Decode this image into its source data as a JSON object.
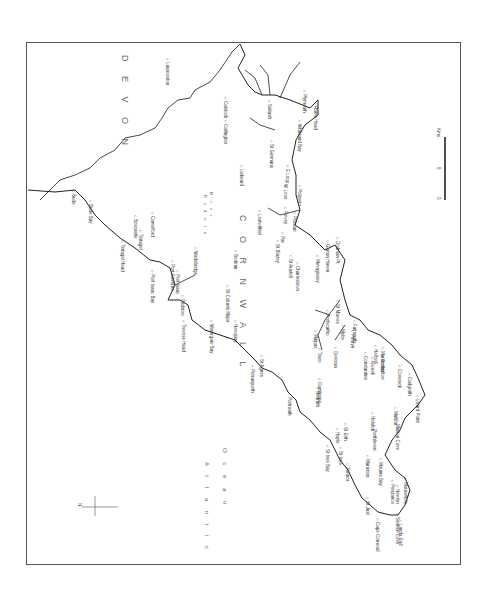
{
  "map": {
    "region_labels": {
      "county_main": "C O R N W A L L",
      "county_neighbor": "D E V O N",
      "ocean_line1": "A t l a n t i c",
      "ocean_line2": "O c e a n",
      "moor_line1": "B o d m i n",
      "moor_line2": "M o o r"
    },
    "compass": {
      "label": "N"
    },
    "scale_bar": {
      "start": "0",
      "mid": "5",
      "unit": "Kms"
    },
    "places": [
      {
        "name": "Bude",
        "x": 76,
        "y": 190
      },
      {
        "name": "Bude Bay",
        "x": 93,
        "y": 200
      },
      {
        "name": "Launceston",
        "x": 170,
        "y": 58
      },
      {
        "name": "Callington",
        "x": 228,
        "y": 120
      },
      {
        "name": "Calstock",
        "x": 228,
        "y": 97
      },
      {
        "name": "Saltash",
        "x": 272,
        "y": 100
      },
      {
        "name": "Plymouth",
        "x": 307,
        "y": 90
      },
      {
        "name": "Rame Head",
        "x": 318,
        "y": 102
      },
      {
        "name": "Whitsand Bay",
        "x": 302,
        "y": 120
      },
      {
        "name": "St Germans",
        "x": 274,
        "y": 140
      },
      {
        "name": "E Looe",
        "x": 290,
        "y": 165
      },
      {
        "name": "W Looe",
        "x": 288,
        "y": 180
      },
      {
        "name": "Polperro",
        "x": 302,
        "y": 185
      },
      {
        "name": "Liskeard",
        "x": 244,
        "y": 165
      },
      {
        "name": "Lostwithiel",
        "x": 262,
        "y": 210
      },
      {
        "name": "Fowey",
        "x": 288,
        "y": 207
      },
      {
        "name": "Polruan",
        "x": 297,
        "y": 212
      },
      {
        "name": "Boscastle",
        "x": 138,
        "y": 215
      },
      {
        "name": "Tintagel",
        "x": 143,
        "y": 230
      },
      {
        "name": "Tintagel Head",
        "x": 125,
        "y": 240
      },
      {
        "name": "Camelford",
        "x": 155,
        "y": 212
      },
      {
        "name": "Port Isaac Bay",
        "x": 155,
        "y": 270
      },
      {
        "name": "Port Gaverne",
        "x": 175,
        "y": 260
      },
      {
        "name": "Port Isaac",
        "x": 180,
        "y": 270
      },
      {
        "name": "Wadebridge",
        "x": 198,
        "y": 247
      },
      {
        "name": "Bodmin",
        "x": 238,
        "y": 250
      },
      {
        "name": "Padstow",
        "x": 185,
        "y": 295
      },
      {
        "name": "Trevose Head",
        "x": 186,
        "y": 320
      },
      {
        "name": "St Columb Major",
        "x": 230,
        "y": 285
      },
      {
        "name": "Watergate Bay",
        "x": 214,
        "y": 320
      },
      {
        "name": "Newquay",
        "x": 238,
        "y": 320
      },
      {
        "name": "St Austell",
        "x": 293,
        "y": 255
      },
      {
        "name": "Charlestown",
        "x": 300,
        "y": 262
      },
      {
        "name": "St Blazey",
        "x": 280,
        "y": 240
      },
      {
        "name": "Par",
        "x": 285,
        "y": 232
      },
      {
        "name": "Mevagissey",
        "x": 320,
        "y": 255
      },
      {
        "name": "Gorran Haven",
        "x": 330,
        "y": 240
      },
      {
        "name": "Dodman Pt",
        "x": 340,
        "y": 237
      },
      {
        "name": "Portscatho",
        "x": 330,
        "y": 310
      },
      {
        "name": "St Mawes",
        "x": 340,
        "y": 300
      },
      {
        "name": "Truro",
        "x": 322,
        "y": 348
      },
      {
        "name": "Malpas",
        "x": 318,
        "y": 330
      },
      {
        "name": "Devoran",
        "x": 338,
        "y": 347
      },
      {
        "name": "Mylor",
        "x": 345,
        "y": 325
      },
      {
        "name": "Penryn",
        "x": 355,
        "y": 330
      },
      {
        "name": "Falmouth",
        "x": 357,
        "y": 320
      },
      {
        "name": "Perranporth",
        "x": 255,
        "y": 365
      },
      {
        "name": "St Agnes",
        "x": 264,
        "y": 355
      },
      {
        "name": "Portreath",
        "x": 292,
        "y": 393
      },
      {
        "name": "Redruth",
        "x": 320,
        "y": 387
      },
      {
        "name": "Camborne",
        "x": 322,
        "y": 378
      },
      {
        "name": "Hayle",
        "x": 340,
        "y": 428
      },
      {
        "name": "St Erth",
        "x": 348,
        "y": 423
      },
      {
        "name": "St Ives Bay",
        "x": 330,
        "y": 445
      },
      {
        "name": "St Ives",
        "x": 343,
        "y": 447
      },
      {
        "name": "Zennor",
        "x": 350,
        "y": 463
      },
      {
        "name": "St Just",
        "x": 370,
        "y": 497
      },
      {
        "name": "Cape Cornwall",
        "x": 380,
        "y": 518
      },
      {
        "name": "Sennen Cove",
        "x": 400,
        "y": 513
      },
      {
        "name": "Lands End",
        "x": 403,
        "y": 520
      },
      {
        "name": "Penzance",
        "x": 395,
        "y": 480
      },
      {
        "name": "Newlyn",
        "x": 400,
        "y": 485
      },
      {
        "name": "Mousehole",
        "x": 408,
        "y": 478
      },
      {
        "name": "Marazion",
        "x": 370,
        "y": 455
      },
      {
        "name": "Mounts Bay",
        "x": 383,
        "y": 458
      },
      {
        "name": "Porthleven",
        "x": 377,
        "y": 425
      },
      {
        "name": "Helston",
        "x": 375,
        "y": 412
      },
      {
        "name": "Mullion Cove",
        "x": 400,
        "y": 420
      },
      {
        "name": "Mullion",
        "x": 398,
        "y": 407
      },
      {
        "name": "Lizard Point",
        "x": 420,
        "y": 395
      },
      {
        "name": "Cadgwith",
        "x": 412,
        "y": 373
      },
      {
        "name": "Coverack",
        "x": 402,
        "y": 365
      },
      {
        "name": "Porthallow",
        "x": 385,
        "y": 355
      },
      {
        "name": "Manaccan",
        "x": 385,
        "y": 347
      },
      {
        "name": "Gweek",
        "x": 375,
        "y": 357
      },
      {
        "name": "Constantine",
        "x": 368,
        "y": 352
      },
      {
        "name": "Helford",
        "x": 378,
        "y": 345
      }
    ]
  }
}
